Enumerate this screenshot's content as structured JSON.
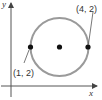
{
  "diagram": {
    "type": "coordinate-plane-circle",
    "axes": {
      "x_label": "x",
      "y_label": "y"
    },
    "circle": {
      "stroke_color": "#9a9a9a"
    },
    "points": [
      {
        "label": "(1, 2)",
        "role": "left-endpoint-of-diameter"
      },
      {
        "label": "",
        "role": "center"
      },
      {
        "label": "(4, 2)",
        "role": "right-endpoint-of-diameter"
      }
    ],
    "colors": {
      "axis": "#444444",
      "point": "#111111",
      "text": "#333333"
    }
  }
}
